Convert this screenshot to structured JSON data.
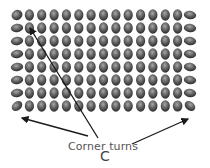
{
  "figure": {
    "annotation_label": "Corner turns",
    "panel_letter": "C",
    "grid": {
      "rows": 8,
      "columns": 15
    },
    "colors": {
      "bead_dark": "#2a2a2a",
      "bead_mid": "#6a6a6a",
      "bead_highlight": "#a8a8a8",
      "arrow": "#1a1a1a",
      "label": "#555555"
    },
    "arrows": [
      {
        "name": "arrow-to-top-left-corner",
        "from": [
          98,
          138
        ],
        "to": [
          30,
          28
        ]
      },
      {
        "name": "arrow-to-bottom-left-corner",
        "from": [
          88,
          136
        ],
        "to": [
          22,
          118
        ]
      },
      {
        "name": "arrow-to-bottom-right-corner",
        "from": [
          132,
          144
        ],
        "to": [
          188,
          119
        ]
      }
    ]
  }
}
